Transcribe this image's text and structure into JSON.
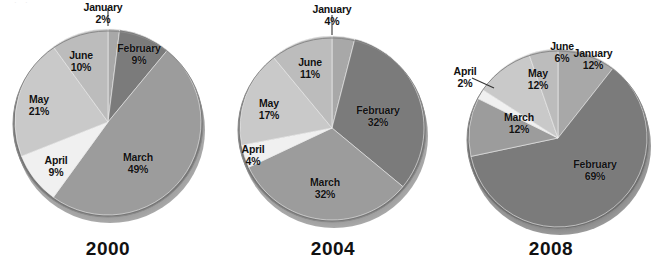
{
  "figure": {
    "background": "#ffffff",
    "label_color": "#111111",
    "year_font_size": 19
  },
  "palette": {
    "January": "#a8a8a8",
    "February": "#7b7b7b",
    "March": "#9c9c9c",
    "April": "#f0f0f0",
    "May": "#c9c9c9",
    "June": "#bcbcbc",
    "shadow": "#5a5a5a",
    "rim": "#6e6e6e"
  },
  "chart_data": [
    {
      "type": "pie",
      "title": "2000",
      "categories": [
        "January",
        "February",
        "March",
        "April",
        "May",
        "June"
      ],
      "values": [
        2,
        9,
        49,
        9,
        21,
        10
      ],
      "labels": [
        {
          "name": "January",
          "pct": "2%",
          "leader": "vertical"
        },
        {
          "name": "February",
          "pct": "9%",
          "leader": "none"
        },
        {
          "name": "March",
          "pct": "49%",
          "leader": "none"
        },
        {
          "name": "April",
          "pct": "9%",
          "leader": "none"
        },
        {
          "name": "May",
          "pct": "21%",
          "leader": "none"
        },
        {
          "name": "June",
          "pct": "10%",
          "leader": "none"
        }
      ],
      "legend": "inside-slices",
      "start_angle": 0,
      "direction": "clockwise"
    },
    {
      "type": "pie",
      "title": "2004",
      "categories": [
        "January",
        "February",
        "March",
        "April",
        "May",
        "June"
      ],
      "values": [
        4,
        32,
        32,
        4,
        17,
        11
      ],
      "labels": [
        {
          "name": "January",
          "pct": "4%",
          "leader": "vertical"
        },
        {
          "name": "February",
          "pct": "32%",
          "leader": "none"
        },
        {
          "name": "March",
          "pct": "32%",
          "leader": "none"
        },
        {
          "name": "April",
          "pct": "4%",
          "leader": "none"
        },
        {
          "name": "May",
          "pct": "17%",
          "leader": "none"
        },
        {
          "name": "June",
          "pct": "11%",
          "leader": "none"
        }
      ],
      "legend": "inside-slices",
      "start_angle": 0,
      "direction": "clockwise"
    },
    {
      "type": "pie",
      "title": "2008",
      "categories": [
        "January",
        "February",
        "March",
        "April",
        "May",
        "June"
      ],
      "values": [
        12,
        69,
        12,
        2,
        12,
        6
      ],
      "labels": [
        {
          "name": "January",
          "pct": "12%",
          "leader": "none"
        },
        {
          "name": "February",
          "pct": "69%",
          "leader": "none"
        },
        {
          "name": "March",
          "pct": "12%",
          "leader": "none"
        },
        {
          "name": "April",
          "pct": "2%",
          "leader": "diagonal"
        },
        {
          "name": "May",
          "pct": "12%",
          "leader": "none"
        },
        {
          "name": "June",
          "pct": "6%",
          "leader": "none"
        }
      ],
      "legend": "inside-slices",
      "start_angle": 0,
      "direction": "clockwise"
    }
  ],
  "charts": {
    "c2000": {
      "year": "2000",
      "january_name": "January",
      "january_pct": "2%",
      "february_name": "February",
      "february_pct": "9%",
      "march_name": "March",
      "march_pct": "49%",
      "april_name": "April",
      "april_pct": "9%",
      "may_name": "May",
      "may_pct": "21%",
      "june_name": "June",
      "june_pct": "10%"
    },
    "c2004": {
      "year": "2004",
      "january_name": "January",
      "january_pct": "4%",
      "february_name": "February",
      "february_pct": "32%",
      "march_name": "March",
      "march_pct": "32%",
      "april_name": "April",
      "april_pct": "4%",
      "may_name": "May",
      "may_pct": "17%",
      "june_name": "June",
      "june_pct": "11%"
    },
    "c2008": {
      "year": "2008",
      "january_name": "January",
      "january_pct": "12%",
      "february_name": "February",
      "february_pct": "69%",
      "march_name": "March",
      "march_pct": "12%",
      "april_name": "April",
      "april_pct": "2%",
      "may_name": "May",
      "may_pct": "12%",
      "june_name": "June",
      "june_pct": "6%"
    }
  }
}
